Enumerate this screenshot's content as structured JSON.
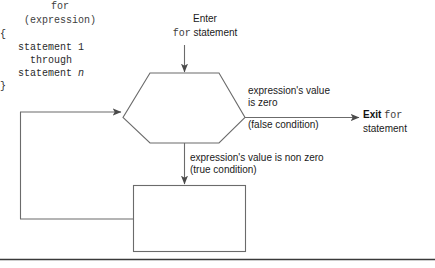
{
  "figure": {
    "kind": "flowchart",
    "line_color": "#6b6b6b",
    "text_color": "#1a1a1a",
    "code_color": "#3d3d3d",
    "rule_color": "#3a3a3a",
    "background": "#ffffff"
  },
  "enter": {
    "line1": "Enter",
    "keyword": "for",
    "line2_rest": " statement"
  },
  "decision": {
    "shape": "hexagon",
    "code_line1": "for",
    "code_line2": "(expression)"
  },
  "false_branch": {
    "label_above": "expression's value is zero",
    "label_above_l1": "expression's value",
    "label_above_l2": "is zero",
    "label_below": "(false condition)"
  },
  "exit": {
    "word": "Exit",
    "keyword": "for",
    "rest": "statement"
  },
  "true_branch": {
    "label_above": "expression's value is non zero",
    "label_below": "(true condition)"
  },
  "statement_block": {
    "open_brace": "{",
    "line_1": "statement 1",
    "line_2": "through",
    "line_3_prefix": "statement ",
    "line_3_italic": "n",
    "close_brace": "}"
  },
  "loop_back": {
    "description": "loop back from statement block to for condition"
  },
  "footer_rule": {
    "present": true
  }
}
